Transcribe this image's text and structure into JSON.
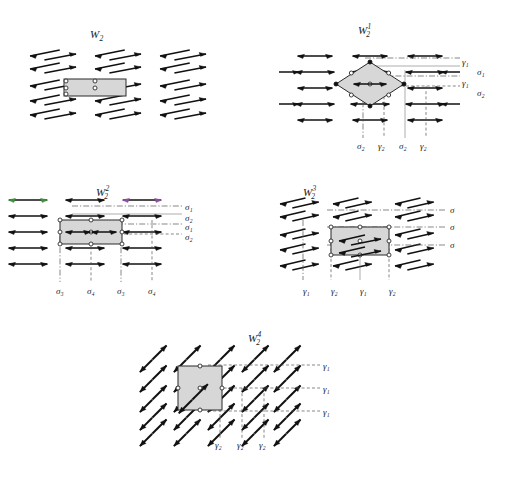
{
  "figure": {
    "background": "#ffffff",
    "cell_fill": "#d7d7d7",
    "line_color": "#111111",
    "accent_green": "#3f8f3f",
    "accent_purple": "#8a4f9e"
  },
  "panels": [
    {
      "id": "p1",
      "title_base": "W",
      "title_sub": "2",
      "title_sup": "",
      "title_text": "W2",
      "cell_shape": "rectangle",
      "arrow_type": "single-head-right",
      "rows": 5,
      "cols": 3,
      "right_labels": [],
      "bottom_labels": []
    },
    {
      "id": "p2",
      "title_base": "W",
      "title_sub": "2",
      "title_sup": "1",
      "title_text": "W2^1",
      "cell_shape": "diamond",
      "arrow_type": "double-head",
      "rows": 5,
      "cols": 3,
      "right_labels": [
        "γ₁",
        "σ₁",
        "γ₁",
        "σ₂"
      ],
      "bottom_labels": [
        "σ₂",
        "γ₂",
        "σ₂",
        "γ₂"
      ]
    },
    {
      "id": "p3",
      "title_base": "W",
      "title_sub": "2",
      "title_sup": "2",
      "title_text": "W2^2",
      "cell_shape": "rectangle",
      "arrow_type": "double-head",
      "rows": 5,
      "cols": 3,
      "right_labels": [
        "σ₁",
        "σ₂",
        "σ₁",
        "σ₂"
      ],
      "bottom_labels": [
        "σ₃",
        "σ₄",
        "σ₃",
        "σ₄"
      ]
    },
    {
      "id": "p4",
      "title_base": "W",
      "title_sub": "2",
      "title_sup": "3",
      "title_text": "W2^3",
      "cell_shape": "rectangle",
      "arrow_type": "single-head-mixed",
      "rows": 5,
      "cols": 3,
      "right_labels": [
        "σ",
        "σ",
        "σ"
      ],
      "bottom_labels": [
        "γ₁",
        "γ₂",
        "γ₁",
        "γ₂"
      ]
    },
    {
      "id": "p5",
      "title_base": "W",
      "title_sub": "2",
      "title_sup": "4",
      "title_text": "W2^4",
      "cell_shape": "square",
      "arrow_type": "diagonal-zigzag",
      "rows": 5,
      "cols": 4,
      "right_labels": [
        "γ₁",
        "γ₁",
        "γ₁"
      ],
      "bottom_labels": [
        "γ₂",
        "γ₂",
        "γ₂"
      ]
    }
  ],
  "symbols": {
    "gamma1": "γ₁",
    "gamma2": "γ₂",
    "sigma": "σ",
    "sigma1": "σ₁",
    "sigma2": "σ₂",
    "sigma3": "σ₃",
    "sigma4": "σ₄"
  }
}
